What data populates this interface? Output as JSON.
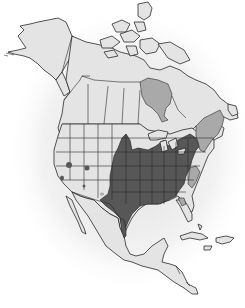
{
  "map": {
    "title": "",
    "region": "North America",
    "colors": {
      "background": "#ffffff",
      "land": "#e4e4e4",
      "primary_range": "#575757",
      "secondary_range": "#a9a9a9",
      "borders": "#2a2a2a",
      "glow": "#cfcfcf"
    },
    "legend": [],
    "regions": [
      {
        "name": "primary-range",
        "description": "Central and eastern United States, from Texas and the Great Plains east to the Atlantic coast",
        "shade": "dark"
      },
      {
        "name": "secondary-range-hudson-bay",
        "description": "Hudson Bay",
        "shade": "medium"
      },
      {
        "name": "secondary-range-northeast",
        "description": "New England, Maritime provinces and southern Quebec",
        "shade": "medium"
      },
      {
        "name": "secondary-range-southeast-fringe",
        "description": "Coastal Carolinas and Florida fringe",
        "shade": "medium"
      },
      {
        "name": "isolated-spots-west",
        "description": "Small isolated patches in Nevada, Utah, Arizona, California and Saskatchewan",
        "shade": "dark"
      }
    ]
  }
}
